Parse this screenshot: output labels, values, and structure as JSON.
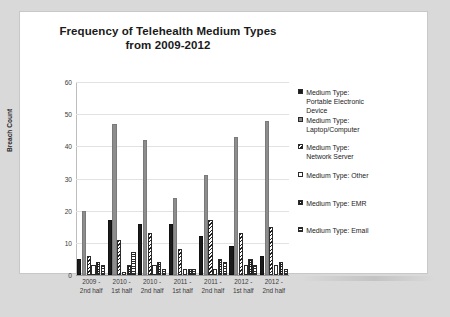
{
  "chart_data": {
    "type": "bar",
    "title": "Frequency of Telehealth Medium Types from 2009-2012",
    "xlabel": "",
    "ylabel": "Breach Count",
    "ylim": [
      0,
      60
    ],
    "yticks": [
      0,
      10,
      20,
      30,
      40,
      50,
      60
    ],
    "grid": true,
    "legend_position": "right",
    "categories": [
      "2009 - 2nd half",
      "2010 - 1st half",
      "2010 - 2nd half",
      "2011 - 1st half",
      "2011 - 2nd half",
      "2012 - 1st half",
      "2012 - 2nd half"
    ],
    "category_lines": [
      [
        "2009 -",
        "2nd half"
      ],
      [
        "2010 -",
        "1st half"
      ],
      [
        "2010 -",
        "2nd half"
      ],
      [
        "2011 -",
        "1st half"
      ],
      [
        "2011 -",
        "2nd half"
      ],
      [
        "2012 -",
        "1st half"
      ],
      [
        "2012 -",
        "2nd half"
      ]
    ],
    "series": [
      {
        "name": "Medium Type: Portable Electronic Device",
        "legend_label": "Medium Type:\nPortable Electronic\nDevice",
        "fill": "solid-black",
        "color": "#1b1b1b",
        "values": [
          5,
          17,
          16,
          16,
          12,
          9,
          6
        ]
      },
      {
        "name": "Medium Type: Laptop/Computer",
        "legend_label": "Medium Type:\nLaptop/Computer",
        "fill": "solid-gray",
        "color": "#8d8d8d",
        "values": [
          20,
          47,
          42,
          24,
          31,
          43,
          48
        ]
      },
      {
        "name": "Medium Type: Network Server",
        "legend_label": "Medium Type:\nNetwork Server",
        "fill": "diagonal-hatch",
        "color": "#1f1f1f",
        "values": [
          6,
          11,
          13,
          8,
          17,
          13,
          15
        ]
      },
      {
        "name": "Medium Type: Other",
        "legend_label": "Medium Type: Other",
        "fill": "empty-white",
        "color": "#ffffff",
        "values": [
          3,
          1,
          3,
          2,
          2,
          3,
          3
        ]
      },
      {
        "name": "Medium Type: EMR",
        "legend_label": "Medium Type: EMR",
        "fill": "checkered",
        "color": "#1f1f1f",
        "values": [
          4,
          3,
          4,
          2,
          5,
          5,
          4
        ]
      },
      {
        "name": "Medium Type: Email",
        "legend_label": "Medium Type: Email",
        "fill": "horizontal-lines",
        "color": "#2a2a2a",
        "values": [
          3,
          7,
          2,
          2,
          4,
          3,
          2
        ]
      }
    ]
  }
}
